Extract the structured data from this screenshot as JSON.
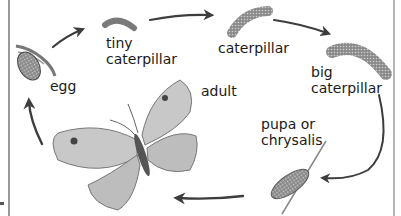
{
  "diagram": {
    "type": "life-cycle",
    "stages": [
      {
        "id": "egg",
        "label": "egg"
      },
      {
        "id": "tiny-caterpillar",
        "label": "tiny\ncaterpillar"
      },
      {
        "id": "caterpillar",
        "label": "caterpillar"
      },
      {
        "id": "big-caterpillar",
        "label": "big\ncaterpillar"
      },
      {
        "id": "pupa",
        "label": "pupa or\nchrysalis"
      },
      {
        "id": "adult",
        "label": "adult"
      }
    ],
    "flow": [
      "egg",
      "tiny-caterpillar",
      "caterpillar",
      "big-caterpillar",
      "pupa",
      "adult",
      "egg"
    ],
    "colors": {
      "arrow": "#3d3d3d",
      "illustration": "#6e6e6e",
      "text": "#1a1a1a",
      "frame": "#9a9a9a"
    }
  }
}
